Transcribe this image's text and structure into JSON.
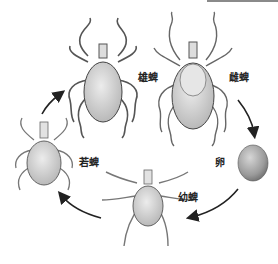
{
  "diagram": {
    "type": "life-cycle",
    "stages": [
      {
        "id": "male",
        "label": "雄蜱"
      },
      {
        "id": "female",
        "label": "雌蜱"
      },
      {
        "id": "egg",
        "label": "卵"
      },
      {
        "id": "larva",
        "label": "幼蜱"
      },
      {
        "id": "nymph",
        "label": "若蜱"
      }
    ],
    "arrows": [
      {
        "from": "female",
        "to": "egg"
      },
      {
        "from": "egg",
        "to": "larva"
      },
      {
        "from": "larva",
        "to": "nymph"
      },
      {
        "from": "nymph",
        "to": "male"
      }
    ],
    "colors": {
      "ink": "#222222",
      "body_fill": "#cfcfcf",
      "egg_fill": "#9a9a9a",
      "background": "#ffffff"
    }
  }
}
